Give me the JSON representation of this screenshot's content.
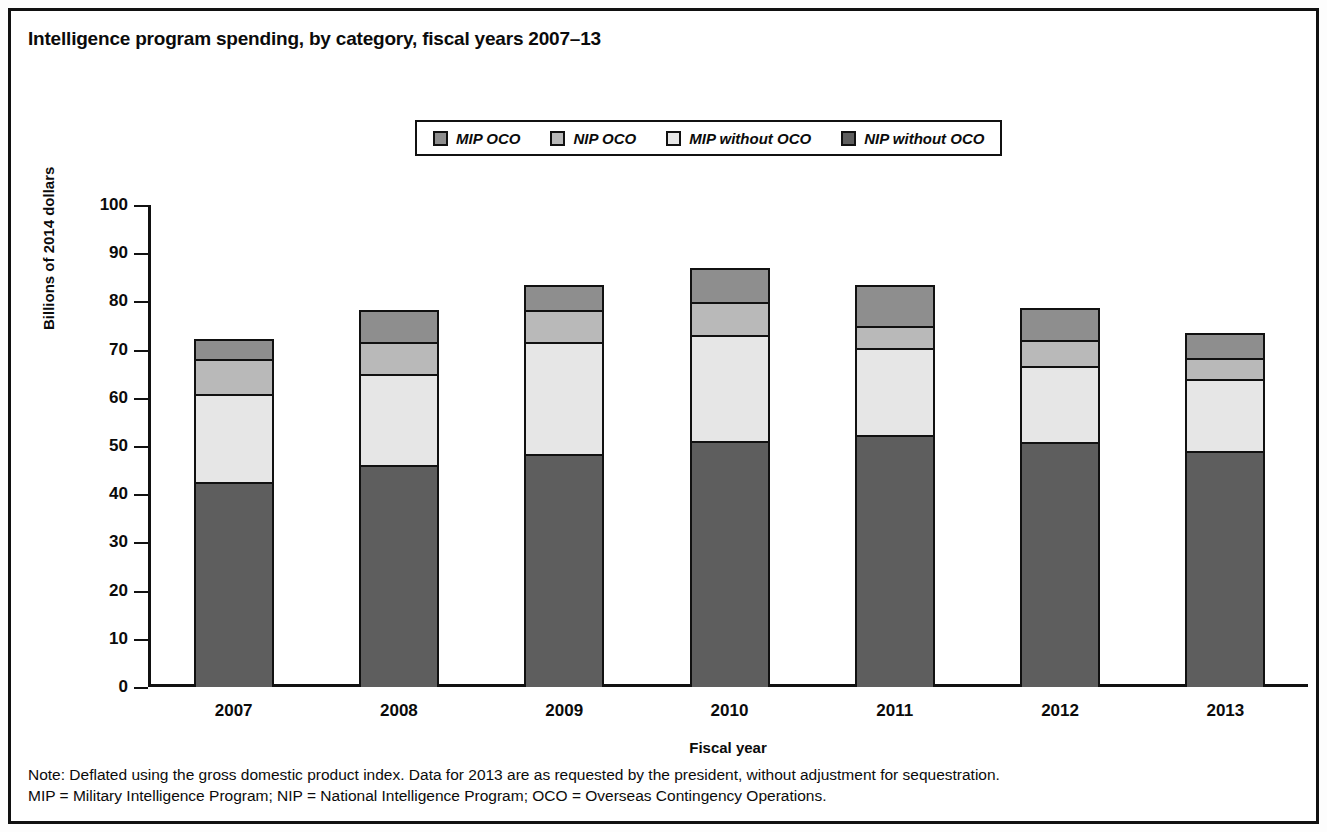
{
  "figure": {
    "title": "Intelligence program spending, by category, fiscal years 2007–13"
  },
  "notes": {
    "line1": "Note: Deflated using the gross domestic product index. Data for 2013 are as requested by the president, without adjustment for sequestration.",
    "line2": "MIP = Military Intelligence Program; NIP = National Intelligence Program; OCO = Overseas Contingency Operations."
  },
  "colors": {
    "mip_oco": "#8e8e8e",
    "nip_oco": "#b9b9b9",
    "mip_without_oco": "#e6e6e6",
    "nip_without_oco": "#5e5e5e",
    "outline": "#111111"
  },
  "chart_data": {
    "type": "bar",
    "stacked": true,
    "title": "Intelligence program spending, by category, fiscal years 2007–13",
    "xlabel": "Fiscal year",
    "ylabel": "Billions of 2014 dollars",
    "ylim": [
      0,
      100
    ],
    "yticks": [
      0,
      10,
      20,
      30,
      40,
      50,
      60,
      70,
      80,
      90,
      100
    ],
    "grid": false,
    "legend_position": "top-center",
    "categories": [
      "2007",
      "2008",
      "2009",
      "2010",
      "2011",
      "2012",
      "2013"
    ],
    "series": [
      {
        "name": "NIP without OCO",
        "values": [
          42.6,
          46.0,
          48.3,
          51.0,
          52.3,
          50.8,
          49.0
        ]
      },
      {
        "name": "MIP without OCO",
        "values": [
          18.2,
          19.0,
          23.2,
          22.0,
          18.1,
          15.7,
          15.0
        ]
      },
      {
        "name": "NIP OCO",
        "values": [
          7.3,
          6.6,
          6.8,
          6.9,
          4.5,
          5.5,
          4.2
        ]
      },
      {
        "name": "MIP OCO",
        "values": [
          4.2,
          6.6,
          5.1,
          7.1,
          8.6,
          6.6,
          5.2
        ]
      }
    ],
    "totals": [
      72.3,
      78.2,
      83.4,
      87.0,
      83.5,
      78.6,
      73.4
    ]
  }
}
